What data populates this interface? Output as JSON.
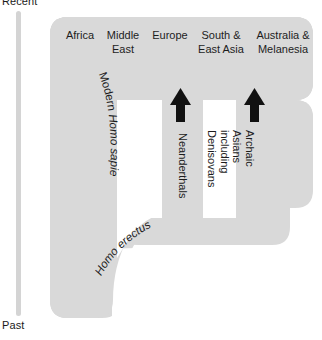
{
  "figure": {
    "type": "phylogeny-diagram"
  },
  "time_axis": {
    "name": "time-axis",
    "top_label": "Recent",
    "bottom_label": "Past",
    "color": "#d4d4d4"
  },
  "regions": {
    "label": "Geographic regions",
    "columns": [
      {
        "id": "africa",
        "label": "Africa"
      },
      {
        "id": "middle-east",
        "label": "Middle\nEast"
      },
      {
        "id": "europe",
        "label": "Europe"
      },
      {
        "id": "south-east-asia",
        "label": "South &\nEast Asia"
      },
      {
        "id": "australia-melanesia",
        "label": "Australia &\nMelanesia"
      }
    ]
  },
  "lineages": [
    {
      "id": "modern-humans",
      "label_plain": "Modern ",
      "label_italic": "Homo sapiens",
      "orientation": "curved"
    },
    {
      "id": "homo-erectus",
      "label_plain": "",
      "label_italic": "Homo erectus",
      "orientation": "curved"
    },
    {
      "id": "neanderthals",
      "label": "Neanderthals",
      "orientation": "vertical"
    },
    {
      "id": "archaic-asians",
      "label": "Archaic Asians\nincluding Denisovans",
      "orientation": "vertical"
    }
  ],
  "gene_flow": [
    {
      "id": "neanderthal-admixture",
      "label": "",
      "target": "europe",
      "direction": "up"
    },
    {
      "id": "denisovan-admixture",
      "label": "",
      "target": "australia-melanesia",
      "direction": "up"
    }
  ],
  "colors": {
    "tree_fill": "#d9d9d9",
    "arrow": "#111111",
    "text": "#1d1d1d",
    "background": "#ffffff"
  }
}
